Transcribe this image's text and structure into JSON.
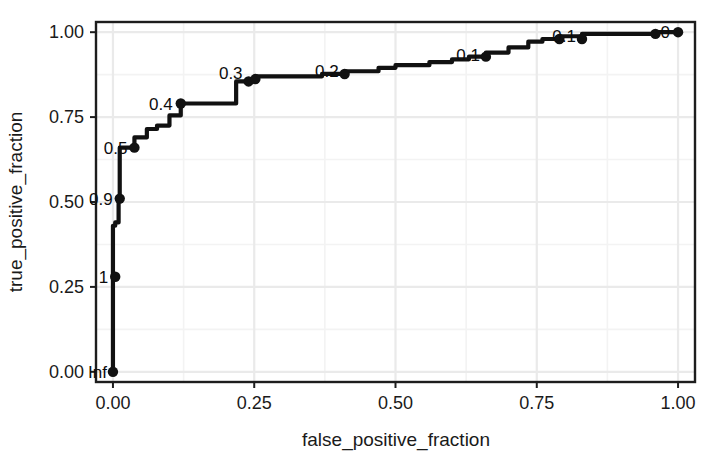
{
  "chart_data": {
    "type": "line",
    "title": "",
    "xlabel": "false_positive_fraction",
    "ylabel": "true_positive_fraction",
    "xlim": [
      -0.03,
      1.03
    ],
    "ylim": [
      -0.03,
      1.03
    ],
    "grid": true,
    "legend": null,
    "xticks": [
      "0.00",
      "0.25",
      "0.50",
      "0.75",
      "1.00"
    ],
    "xtick_values": [
      0.0,
      0.25,
      0.5,
      0.75,
      1.0
    ],
    "yticks": [
      "0.00",
      "0.25",
      "0.50",
      "0.75",
      "1.00"
    ],
    "ytick_values": [
      0.0,
      0.25,
      0.5,
      0.75,
      1.0
    ],
    "line_color": "#111111",
    "marker_color": "#111111",
    "series": [
      {
        "name": "ROC",
        "x": [
          0.0,
          0.0,
          0.0,
          0.004,
          0.004,
          0.01,
          0.01,
          0.012,
          0.012,
          0.038,
          0.038,
          0.06,
          0.06,
          0.078,
          0.078,
          0.1,
          0.1,
          0.12,
          0.12,
          0.2,
          0.2,
          0.218,
          0.218,
          0.24,
          0.24,
          0.252,
          0.252,
          0.37,
          0.37,
          0.41,
          0.41,
          0.47,
          0.47,
          0.5,
          0.5,
          0.56,
          0.56,
          0.6,
          0.6,
          0.63,
          0.63,
          0.66,
          0.66,
          0.7,
          0.7,
          0.735,
          0.735,
          0.76,
          0.76,
          0.79,
          0.79,
          0.83,
          0.83,
          0.96,
          0.96,
          1.0
        ],
        "y": [
          0.0,
          0.28,
          0.43,
          0.43,
          0.44,
          0.44,
          0.51,
          0.51,
          0.66,
          0.66,
          0.69,
          0.69,
          0.715,
          0.715,
          0.725,
          0.725,
          0.755,
          0.755,
          0.79,
          0.79,
          0.79,
          0.79,
          0.855,
          0.855,
          0.862,
          0.862,
          0.87,
          0.87,
          0.877,
          0.877,
          0.885,
          0.885,
          0.895,
          0.895,
          0.903,
          0.903,
          0.912,
          0.912,
          0.92,
          0.92,
          0.928,
          0.928,
          0.94,
          0.94,
          0.955,
          0.955,
          0.972,
          0.972,
          0.98,
          0.98,
          0.988,
          0.988,
          0.995,
          0.995,
          1.0,
          1.0
        ]
      }
    ],
    "markers": [
      {
        "x": 0.0,
        "y": 0.0
      },
      {
        "x": 0.004,
        "y": 0.28
      },
      {
        "x": 0.012,
        "y": 0.51
      },
      {
        "x": 0.038,
        "y": 0.66
      },
      {
        "x": 0.12,
        "y": 0.79
      },
      {
        "x": 0.24,
        "y": 0.855
      },
      {
        "x": 0.252,
        "y": 0.862
      },
      {
        "x": 0.41,
        "y": 0.877
      },
      {
        "x": 0.66,
        "y": 0.928
      },
      {
        "x": 0.79,
        "y": 0.98
      },
      {
        "x": 0.83,
        "y": 0.98
      },
      {
        "x": 0.96,
        "y": 0.995
      },
      {
        "x": 1.0,
        "y": 1.0
      }
    ],
    "threshold_labels": [
      {
        "text": "Inf",
        "x": 0.0,
        "y": 0.0,
        "anchor": "end",
        "dx": -6,
        "dy": 6
      },
      {
        "text": "1",
        "x": 0.004,
        "y": 0.28,
        "anchor": "end",
        "dx": -7,
        "dy": 6
      },
      {
        "text": "0.9",
        "x": 0.012,
        "y": 0.51,
        "anchor": "end",
        "dx": -7,
        "dy": 6
      },
      {
        "text": "0.5",
        "x": 0.038,
        "y": 0.66,
        "anchor": "end",
        "dx": -7,
        "dy": 6
      },
      {
        "text": "0.4",
        "x": 0.12,
        "y": 0.79,
        "anchor": "end",
        "dx": -8,
        "dy": 6
      },
      {
        "text": "0.3",
        "x": 0.24,
        "y": 0.862,
        "anchor": "end",
        "dx": -6,
        "dy": 0
      },
      {
        "text": "0.2",
        "x": 0.41,
        "y": 0.877,
        "anchor": "end",
        "dx": -6,
        "dy": 3
      },
      {
        "text": "0.1",
        "x": 0.66,
        "y": 0.928,
        "anchor": "end",
        "dx": -6,
        "dy": 4
      },
      {
        "text": "0.1",
        "x": 0.83,
        "y": 0.98,
        "anchor": "end",
        "dx": -6,
        "dy": 3
      },
      {
        "text": "0",
        "x": 1.0,
        "y": 0.995,
        "anchor": "end",
        "dx": -8,
        "dy": 4
      }
    ]
  }
}
